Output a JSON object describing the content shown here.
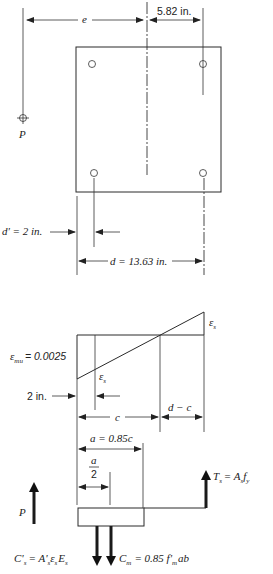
{
  "section": {
    "dim_e_label": "e",
    "dim_582": "5.82 in.",
    "load_label": "P",
    "dim_dprime": "d' = 2 in.",
    "dim_d": "d = 13.63 in."
  },
  "strain": {
    "emu_label": "ε",
    "emu_sub": "mu",
    "emu_value": "= 0.0025",
    "es_label": "ε",
    "es_sub": "s",
    "esp_label": "ε",
    "esp_sub": "s",
    "dim_2in": "2 in.",
    "dim_c": "c",
    "dim_dminusc": "d − c"
  },
  "forces": {
    "dim_a": "a = 0.85c",
    "dim_a2_num": "a",
    "dim_a2_den": "2",
    "load_label": "P",
    "ts_label": "T",
    "ts_sub": "s",
    "ts_eq": "= A",
    "ts_eq_sub": "s",
    "ts_fy": "f",
    "ts_fy_sub": "y",
    "csp_label": "C'",
    "csp_sub": "s",
    "csp_eq": "= A'",
    "csp_eq_sub": "s",
    "csp_eps": "ε",
    "csp_eps_sub": "s",
    "csp_E": "E",
    "csp_E_sub": "s",
    "cm_label": "C",
    "cm_sub": "m",
    "cm_eq": "= 0.85 f'",
    "cm_eq_sub": "m",
    "cm_tail": "ab"
  }
}
